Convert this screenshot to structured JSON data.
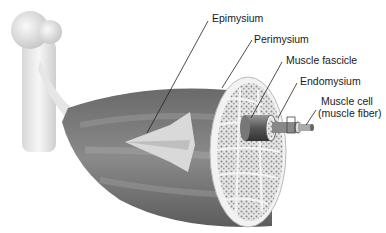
{
  "diagram": {
    "labels": [
      {
        "id": "epimysium",
        "text": "Epimysium"
      },
      {
        "id": "perimysium",
        "text": "Perimysium"
      },
      {
        "id": "muscle_fascicle",
        "text": "Muscle fascicle"
      },
      {
        "id": "endomysium",
        "text": "Endomysium"
      },
      {
        "id": "muscle_cell_line1",
        "text": "Muscle cell"
      },
      {
        "id": "muscle_cell_line2",
        "text": "(muscle fiber)"
      }
    ]
  }
}
